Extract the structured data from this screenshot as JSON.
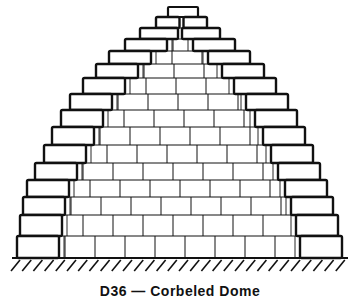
{
  "figure": {
    "caption": "D36 — Corbeled Dome",
    "ink_color": "#111111",
    "background": "#ffffff",
    "ground": {
      "y": 258,
      "x1": 12,
      "x2": 348,
      "hatch_count": 30
    },
    "outer_steps": [
      {
        "y": 7,
        "h": 10,
        "lx": 168,
        "rx": 198
      },
      {
        "y": 17,
        "h": 11,
        "lx": 156,
        "rx": 207
      },
      {
        "y": 28,
        "h": 11,
        "lx": 140,
        "rx": 220
      },
      {
        "y": 39,
        "h": 12,
        "lx": 125,
        "rx": 235
      },
      {
        "y": 51,
        "h": 13,
        "lx": 109,
        "rx": 250
      },
      {
        "y": 64,
        "h": 14,
        "lx": 96,
        "rx": 264
      },
      {
        "y": 78,
        "h": 16,
        "lx": 83,
        "rx": 276
      },
      {
        "y": 94,
        "h": 16,
        "lx": 70,
        "rx": 288
      },
      {
        "y": 110,
        "h": 17,
        "lx": 61,
        "rx": 297
      },
      {
        "y": 127,
        "h": 18,
        "lx": 52,
        "rx": 305
      },
      {
        "y": 145,
        "h": 18,
        "lx": 44,
        "rx": 313
      },
      {
        "y": 163,
        "h": 17,
        "lx": 35,
        "rx": 320
      },
      {
        "y": 180,
        "h": 17,
        "lx": 27,
        "rx": 327
      },
      {
        "y": 197,
        "h": 18,
        "lx": 23,
        "rx": 333
      },
      {
        "y": 215,
        "h": 21,
        "lx": 20,
        "rx": 338
      },
      {
        "y": 236,
        "h": 22,
        "lx": 17,
        "rx": 342
      }
    ],
    "outer_block_width": 42
  }
}
